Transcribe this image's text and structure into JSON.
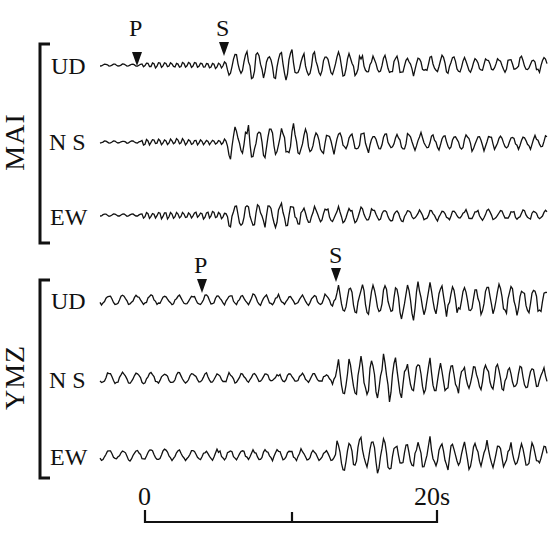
{
  "chart_data": {
    "type": "line",
    "title": "",
    "xlabel": "time",
    "time_scale": {
      "start_label": "0",
      "end_label": "20s",
      "start_s": 0,
      "end_s": 20,
      "mid_tick_s": 10
    },
    "grid": false,
    "stations": [
      {
        "name": "MAI",
        "components": [
          {
            "label": "UD",
            "noise_amp": 1.5,
            "pre_s_amp": 5,
            "post_s_amp": 22,
            "coda_amp": 12
          },
          {
            "label": "N S",
            "noise_amp": 1.5,
            "pre_s_amp": 5,
            "post_s_amp": 26,
            "coda_amp": 10
          },
          {
            "label": "EW",
            "noise_amp": 1.5,
            "pre_s_amp": 6,
            "post_s_amp": 18,
            "coda_amp": 7
          }
        ],
        "arrivals": [
          {
            "phase": "P",
            "time_s": -0.3
          },
          {
            "phase": "S",
            "time_s": 5.6
          }
        ]
      },
      {
        "name": "YMZ",
        "components": [
          {
            "label": "UD",
            "noise_amp": 6,
            "pre_s_amp": 9,
            "post_s_amp": 26,
            "coda_amp": 20
          },
          {
            "label": "N S",
            "noise_amp": 7,
            "pre_s_amp": 8,
            "post_s_amp": 32,
            "coda_amp": 14
          },
          {
            "label": "EW",
            "noise_amp": 7,
            "pre_s_amp": 9,
            "post_s_amp": 26,
            "coda_amp": 16
          }
        ],
        "arrivals": [
          {
            "phase": "P",
            "time_s": 3.9
          },
          {
            "phase": "S",
            "time_s": 13.1
          }
        ]
      }
    ]
  },
  "labels": {
    "station_1": "MAI",
    "station_2": "YMZ",
    "mai_ud": "UD",
    "mai_ns": "N S",
    "mai_ew": "EW",
    "ymz_ud": "UD",
    "ymz_ns": "N S",
    "ymz_ew": "EW",
    "mai_p": "P",
    "mai_s": "S",
    "ymz_p": "P",
    "ymz_s": "S",
    "scale_start": "0",
    "scale_end": "20s"
  },
  "colors": {
    "ink": "#111111",
    "background": "#ffffff"
  }
}
